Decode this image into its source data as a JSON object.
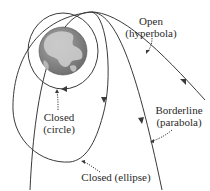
{
  "diagram": {
    "central_body": "earth",
    "orbits": [
      {
        "id": "circle",
        "type": "closed",
        "label_line1": "Closed",
        "label_line2": "(circle)"
      },
      {
        "id": "ellipse",
        "type": "closed",
        "label_line1": "Closed (ellipse)",
        "label_line2": ""
      },
      {
        "id": "parabola",
        "type": "borderline",
        "label_line1": "Borderline",
        "label_line2": "(parabola)"
      },
      {
        "id": "hyperbola",
        "type": "open",
        "label_line1": "Open",
        "label_line2": "(hyperbola)"
      }
    ],
    "colors": {
      "line": "#3a3a3a",
      "earth_ocean": "#8a8a8a",
      "earth_land": "#d8d8d8",
      "text": "#2a2a2a",
      "background": "#ffffff"
    }
  }
}
